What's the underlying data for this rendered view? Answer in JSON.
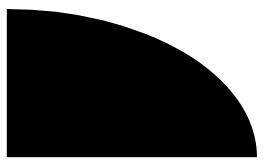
{
  "shape": {
    "type": "quarter-ellipse",
    "fill": "#000000",
    "background": "#ffffff",
    "origin": {
      "x": 7,
      "y": 157
    },
    "rx": 250,
    "ry": 148
  }
}
